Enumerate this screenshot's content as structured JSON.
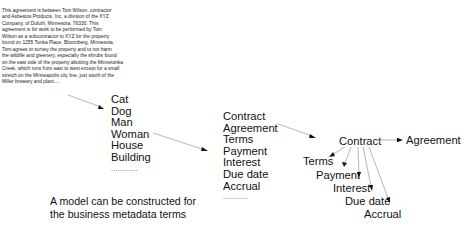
{
  "source_text": {
    "lines": [
      "This agreement is between Tom Wilson, contractor",
      "and Asbestos Products, Inc, a division of the XYZ",
      "Company, of Duluth, Minnesota, 76330. This",
      "agreement is for work to be performed by Tom",
      "Wilson as a subcontractor to XYZ for the property",
      "found on 1255 Tonka Place, Bloomberg, Minnesota.",
      "Tom agrees to survey the property and to not harm",
      "the wildlife and greenery, especially the shrubs found",
      "on the east side of the property abutting the Minnetonka",
      "Creek, which runs from east to west except for a small",
      "stretch on the Minneapolis city line, just south of the",
      "Miller brewery and plant....."
    ]
  },
  "generic_terms": {
    "items": [
      "Cat",
      "Dog",
      "Man",
      "Woman",
      "House",
      "Building"
    ],
    "ellipsis": "............"
  },
  "business_terms": {
    "items": [
      "Contract",
      "Agreement",
      "Terms",
      "Payment",
      "Interest",
      "Due date",
      "Accrual"
    ],
    "ellipsis": "..........."
  },
  "model": {
    "root": "Contract",
    "synonym": "Agreement",
    "children": [
      "Terms",
      "Payment",
      "Interest",
      "Due date",
      "Accrual"
    ]
  },
  "caption": {
    "lines": [
      "A model can be constructed for",
      "the business metadata terms"
    ]
  },
  "colors": {
    "connector": "#9a9a9a",
    "arrowhead": "#111111",
    "text": "#111111"
  }
}
